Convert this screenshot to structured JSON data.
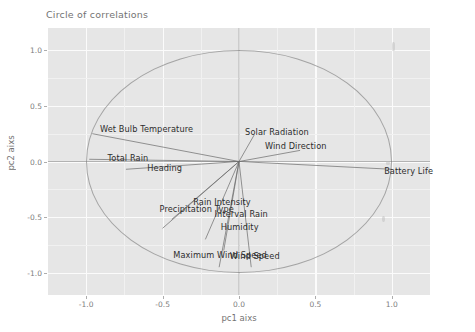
{
  "chart_data": {
    "type": "scatter",
    "title": "Circle of correlations",
    "xlabel": "pc1 aixs",
    "ylabel": "pc2 aixs",
    "xlim": [
      -1.25,
      1.25
    ],
    "ylim": [
      -1.2,
      1.2
    ],
    "grid": true,
    "legend": "none",
    "xticks": [
      "-1.0",
      "-0.5",
      "0.0",
      "0.5",
      "1.0"
    ],
    "xtick_values": [
      -1.0,
      -0.5,
      0.0,
      0.5,
      1.0
    ],
    "yticks": [
      "-1.0",
      "-0.5",
      "0.0",
      "0.5",
      "1.0"
    ],
    "ytick_values": [
      -1.0,
      -0.5,
      0.0,
      0.5,
      1.0
    ],
    "unit_circle": true,
    "unit_circle_radius": 1.0,
    "origin": [
      0.0,
      0.0
    ],
    "variables": [
      {
        "label": "Wet.Bulb.Temperature",
        "pc1": -0.96,
        "pc2": 0.25,
        "label_x": -0.91,
        "label_y": 0.28,
        "align": "left"
      },
      {
        "label": "Total.Rain",
        "pc1": -0.98,
        "pc2": 0.02,
        "label_x": -0.86,
        "label_y": 0.02,
        "align": "left"
      },
      {
        "label": "Heading",
        "pc1": -0.74,
        "pc2": -0.07,
        "label_x": -0.6,
        "label_y": -0.07,
        "align": "left"
      },
      {
        "label": "Solar.Radiation",
        "pc1": 0.1,
        "pc2": 0.24,
        "label_x": 0.04,
        "label_y": 0.26,
        "align": "left"
      },
      {
        "label": "Wind.Direction",
        "pc1": 0.4,
        "pc2": 0.1,
        "label_x": 0.17,
        "label_y": 0.13,
        "align": "left"
      },
      {
        "label": "Battery.Life",
        "pc1": 1.0,
        "pc2": -0.07,
        "label_x": 0.95,
        "label_y": -0.09,
        "align": "left"
      },
      {
        "label": "Rain.Intensity",
        "pc1": -0.44,
        "pc2": -0.52,
        "label_x": -0.3,
        "label_y": -0.37,
        "align": "left"
      },
      {
        "label": "Precipitation.Type",
        "pc1": -0.5,
        "pc2": -0.6,
        "label_x": -0.52,
        "label_y": -0.44,
        "align": "left"
      },
      {
        "label": "Interval.Rain",
        "pc1": -0.22,
        "pc2": -0.7,
        "label_x": -0.16,
        "label_y": -0.48,
        "align": "left"
      },
      {
        "label": "Humidity",
        "pc1": -0.1,
        "pc2": -0.8,
        "label_x": -0.12,
        "label_y": -0.6,
        "align": "left"
      },
      {
        "label": "Maximum.Wind.Speed",
        "pc1": -0.13,
        "pc2": -0.95,
        "label_x": -0.43,
        "label_y": -0.85,
        "align": "left"
      },
      {
        "label": "Wind.Speed",
        "pc1": 0.08,
        "pc2": -0.95,
        "label_x": -0.06,
        "label_y": -0.86,
        "align": "left"
      }
    ],
    "theme": {
      "panel_background": "#e6e6e6",
      "grid_major": "#fbfbfb",
      "grid_minor": "#f1f1f1",
      "vector_color": "#6d6d6d",
      "circle_color": "#8e8e8e",
      "text_color": "#2d2d2d",
      "plot_background": "#ffffff"
    }
  }
}
